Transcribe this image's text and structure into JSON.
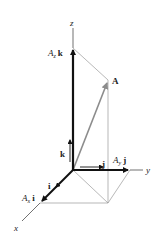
{
  "diagram": {
    "axes": {
      "x": "x",
      "y": "y",
      "z": "z"
    },
    "vector": "A",
    "unit_vectors": {
      "i": "i",
      "j": "j",
      "k": "k"
    },
    "components": {
      "x": {
        "scalar": "A",
        "sub": "x",
        "unit": "i"
      },
      "y": {
        "scalar": "A",
        "sub": "y",
        "unit": "j"
      },
      "z": {
        "scalar": "A",
        "sub": "z",
        "unit": "k"
      }
    },
    "colors": {
      "axis": "#333333",
      "component": "#111111",
      "resultant": "#8c8c8c",
      "construction": "#9a9a9a"
    }
  }
}
